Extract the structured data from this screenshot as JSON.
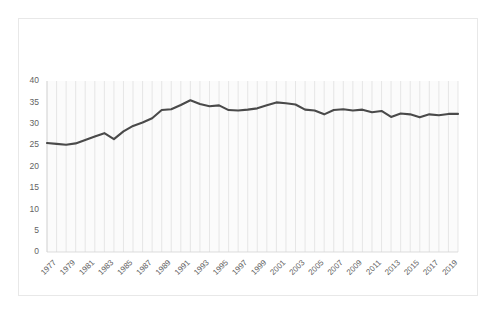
{
  "chart_data": {
    "type": "line",
    "title": "",
    "subtitle": "",
    "xlabel": "",
    "ylabel": "",
    "ylim": [
      0,
      40
    ],
    "xlim": [
      1976,
      2019
    ],
    "grid": "vertical",
    "legend": "none",
    "y_ticks": [
      0,
      5,
      10,
      15,
      20,
      25,
      30,
      35,
      40
    ],
    "x_tick_labels": [
      "1977",
      "1979",
      "1981",
      "1983",
      "1985",
      "1987",
      "1989",
      "1991",
      "1993",
      "1995",
      "1997",
      "1999",
      "2001",
      "2003",
      "2005",
      "2007",
      "2009",
      "2011",
      "2013",
      "2015",
      "2017",
      "2019"
    ],
    "x": [
      1976,
      1977,
      1978,
      1979,
      1980,
      1981,
      1982,
      1983,
      1984,
      1985,
      1986,
      1987,
      1988,
      1989,
      1990,
      1991,
      1992,
      1993,
      1994,
      1995,
      1996,
      1997,
      1998,
      1999,
      2000,
      2001,
      2002,
      2003,
      2004,
      2005,
      2006,
      2007,
      2008,
      2009,
      2010,
      2011,
      2012,
      2013,
      2014,
      2015,
      2016,
      2017,
      2018,
      2019
    ],
    "series": [
      {
        "name": "Series 1",
        "color": "#4a4a4a",
        "values": [
          25.5,
          25.3,
          25.1,
          25.4,
          26.2,
          27.0,
          27.8,
          26.4,
          28.2,
          29.5,
          30.3,
          31.3,
          33.2,
          33.4,
          34.4,
          35.5,
          34.6,
          34.1,
          34.3,
          33.2,
          33.1,
          33.3,
          33.6,
          34.3,
          35.0,
          34.8,
          34.5,
          33.3,
          33.1,
          32.2,
          33.2,
          33.4,
          33.1,
          33.3,
          32.7,
          33.0,
          31.6,
          32.4,
          32.2,
          31.5,
          32.2,
          32.0,
          32.3,
          32.3
        ]
      }
    ]
  },
  "plot_geometry": {
    "left": 47,
    "right": 458,
    "top": 81,
    "bottom": 252
  },
  "colors": {
    "line": "#4a4a4a",
    "grid": "#dcdcdc",
    "tick_text": "#636363",
    "border": "#e8e8e8",
    "plot_background": "#fbfbfb"
  }
}
